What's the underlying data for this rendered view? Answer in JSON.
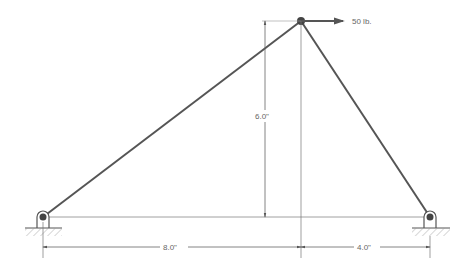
{
  "diagram": {
    "type": "truss",
    "load": {
      "label": "50 lb.",
      "direction": "right"
    },
    "dimensions": {
      "height": "6.0\"",
      "left_span": "8.0\"",
      "right_span": "4.0\""
    },
    "supports": [
      {
        "name": "left-pin",
        "type": "pin"
      },
      {
        "name": "right-pin",
        "type": "pin"
      }
    ],
    "colors": {
      "member": "#555555",
      "dim": "#777777",
      "hatch": "#999999"
    }
  }
}
